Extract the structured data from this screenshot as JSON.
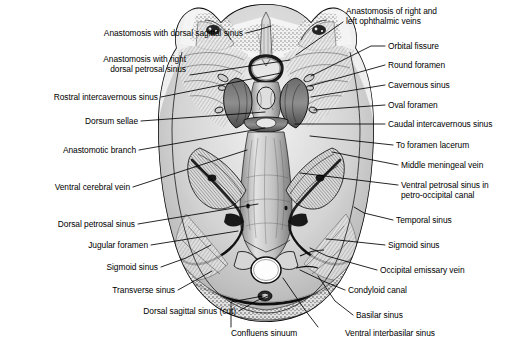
{
  "figure": {
    "signature": "M.N.",
    "width": 532,
    "height": 341,
    "background_color": "#ffffff",
    "line_color": "#000000",
    "text_color": "#000000"
  },
  "illustration": {
    "subject": "skull-base-dorsal-view",
    "description": "Dorsal view of the cranial floor showing dural venous sinuses",
    "foramen_magnum": {
      "cx": 266,
      "cy": 270,
      "rx": 15,
      "ry": 13
    },
    "bounds": {
      "x": 163,
      "y": 4,
      "width": 212,
      "height": 318
    }
  },
  "labels_left": [
    {
      "id": "anastomosis-dorsal-sagittal-sinus",
      "lines": [
        "Anastomosis with dorsal sagittal sinus"
      ],
      "text_right_x": 243,
      "text_top_y": 28,
      "leader": [
        [
          246,
          33
        ],
        [
          258,
          30
        ],
        [
          271,
          26
        ]
      ]
    },
    {
      "id": "anastomosis-right-dorsal-petrosal-sinus",
      "lines": [
        "Anastomosis with right",
        "dorsal petrosal sinus"
      ],
      "text_right_x": 186,
      "text_top_y": 54,
      "leader": [
        [
          190,
          75
        ],
        [
          290,
          60
        ]
      ]
    },
    {
      "id": "rostral-intercavernous-sinus",
      "lines": [
        "Rostral intercavernous sinus"
      ],
      "text_right_x": 158,
      "text_top_y": 92,
      "leader": [
        [
          161,
          97
        ],
        [
          281,
          73
        ]
      ]
    },
    {
      "id": "dorsum-sellae",
      "lines": [
        "Dorsum sellae"
      ],
      "text_right_x": 138,
      "text_top_y": 116,
      "leader": [
        [
          141,
          121
        ],
        [
          265,
          112
        ]
      ]
    },
    {
      "id": "anastomotic-branch",
      "lines": [
        "Anastomotic branch"
      ],
      "text_right_x": 136,
      "text_top_y": 145,
      "leader": [
        [
          139,
          150
        ],
        [
          265,
          128
        ]
      ]
    },
    {
      "id": "ventral-cerebral-vein",
      "lines": [
        "Ventral cerebral vein"
      ],
      "text_right_x": 130,
      "text_top_y": 182,
      "leader": [
        [
          133,
          187
        ],
        [
          247,
          150
        ]
      ]
    },
    {
      "id": "dorsal-petrosal-sinus",
      "lines": [
        "Dorsal petrosal sinus"
      ],
      "text_right_x": 135,
      "text_top_y": 219,
      "leader": [
        [
          138,
          224
        ],
        [
          258,
          204
        ]
      ]
    },
    {
      "id": "jugular-foramen",
      "lines": [
        "Jugular foramen"
      ],
      "text_right_x": 148,
      "text_top_y": 240,
      "leader": [
        [
          151,
          245
        ],
        [
          238,
          231
        ]
      ]
    },
    {
      "id": "sigmoid-sinus-left",
      "lines": [
        "Sigmoid sinus"
      ],
      "text_right_x": 158,
      "text_top_y": 262,
      "leader": [
        [
          161,
          267
        ],
        [
          186,
          258
        ],
        [
          211,
          245
        ]
      ]
    },
    {
      "id": "transverse-sinus",
      "lines": [
        "Transverse sinus"
      ],
      "text_right_x": 175,
      "text_top_y": 285,
      "leader": [
        [
          178,
          290
        ],
        [
          196,
          280
        ],
        [
          212,
          271
        ]
      ]
    },
    {
      "id": "dorsal-sagittal-sinus-cut",
      "lines": [
        "Dorsal sagittal sinus (cut)"
      ],
      "text_right_x": 236,
      "text_top_y": 306,
      "leader": [
        [
          239,
          311
        ],
        [
          256,
          301
        ],
        [
          268,
          296
        ]
      ]
    }
  ],
  "labels_right": [
    {
      "id": "anastomosis-ophthalmic-veins",
      "lines": [
        "Anastomosis of right and",
        "left ophthalmic veins"
      ],
      "text_left_x": 346,
      "text_top_y": 6,
      "leader": [
        [
          343,
          22
        ],
        [
          296,
          55
        ]
      ]
    },
    {
      "id": "orbital-fissure",
      "lines": [
        "Orbital fissure"
      ],
      "text_left_x": 388,
      "text_top_y": 41,
      "leader": [
        [
          385,
          46
        ],
        [
          371,
          46
        ],
        [
          311,
          76
        ]
      ]
    },
    {
      "id": "round-foramen",
      "lines": [
        "Round foramen"
      ],
      "text_left_x": 388,
      "text_top_y": 60,
      "leader": [
        [
          385,
          65
        ],
        [
          310,
          86
        ]
      ]
    },
    {
      "id": "cavernous-sinus",
      "lines": [
        "Cavernous sinus"
      ],
      "text_left_x": 388,
      "text_top_y": 80,
      "leader": [
        [
          385,
          85
        ],
        [
          311,
          97
        ]
      ]
    },
    {
      "id": "oval-foramen",
      "lines": [
        "Oval foramen"
      ],
      "text_left_x": 388,
      "text_top_y": 100,
      "leader": [
        [
          385,
          105
        ],
        [
          314,
          110
        ]
      ]
    },
    {
      "id": "caudal-intercavernous-sinus",
      "lines": [
        "Caudal intercavernous sinus"
      ],
      "text_left_x": 388,
      "text_top_y": 119,
      "leader": [
        [
          385,
          124
        ],
        [
          295,
          124
        ]
      ]
    },
    {
      "id": "to-foramen-lacerum",
      "lines": [
        "To foramen lacerum"
      ],
      "text_left_x": 396,
      "text_top_y": 140,
      "leader": [
        [
          393,
          145
        ],
        [
          310,
          136
        ]
      ]
    },
    {
      "id": "middle-meningeal-vein",
      "lines": [
        "Middle meningeal vein"
      ],
      "text_left_x": 401,
      "text_top_y": 160,
      "leader": [
        [
          398,
          165
        ],
        [
          332,
          152
        ]
      ]
    },
    {
      "id": "ventral-petrosal-sinus",
      "lines": [
        "Ventral petrosal sinus in",
        "petro-occipital canal"
      ],
      "text_left_x": 401,
      "text_top_y": 180,
      "leader": [
        [
          398,
          185
        ],
        [
          300,
          173
        ]
      ]
    },
    {
      "id": "temporal-sinus",
      "lines": [
        "Temporal sinus"
      ],
      "text_left_x": 396,
      "text_top_y": 215,
      "leader": [
        [
          393,
          220
        ],
        [
          364,
          213
        ],
        [
          354,
          207
        ]
      ]
    },
    {
      "id": "sigmoid-sinus-right",
      "lines": [
        "Sigmoid sinus"
      ],
      "text_left_x": 388,
      "text_top_y": 240,
      "leader": [
        [
          385,
          245
        ],
        [
          338,
          240
        ],
        [
          326,
          239
        ]
      ]
    },
    {
      "id": "occipital-emissary-vein",
      "lines": [
        "Occipital emissary vein"
      ],
      "text_left_x": 380,
      "text_top_y": 265,
      "leader": [
        [
          377,
          270
        ],
        [
          327,
          256
        ],
        [
          310,
          248
        ]
      ]
    },
    {
      "id": "condyloid-canal",
      "lines": [
        "Condyloid canal"
      ],
      "text_left_x": 348,
      "text_top_y": 285,
      "leader": [
        [
          345,
          290
        ],
        [
          323,
          281
        ],
        [
          300,
          270
        ]
      ]
    },
    {
      "id": "basilar-sinus",
      "lines": [
        "Basilar sinus"
      ],
      "text_left_x": 356,
      "text_top_y": 310,
      "leader": [
        [
          353,
          315
        ],
        [
          335,
          301
        ],
        [
          318,
          276
        ]
      ]
    }
  ],
  "labels_bottom": [
    {
      "id": "confluens-sinuum",
      "lines": [
        "Confluens sinuum"
      ],
      "text_center_x": 231,
      "text_top_y": 328,
      "leader": [
        [
          231,
          327
        ],
        [
          231,
          302
        ],
        [
          263,
          296
        ]
      ]
    },
    {
      "id": "ventral-interbasilar-sinus",
      "lines": [
        "Ventral interbasilar sinus"
      ],
      "text_center_x": 345,
      "text_top_y": 328,
      "leader": [
        [
          318,
          327
        ],
        [
          305,
          310
        ],
        [
          283,
          278
        ]
      ]
    }
  ]
}
